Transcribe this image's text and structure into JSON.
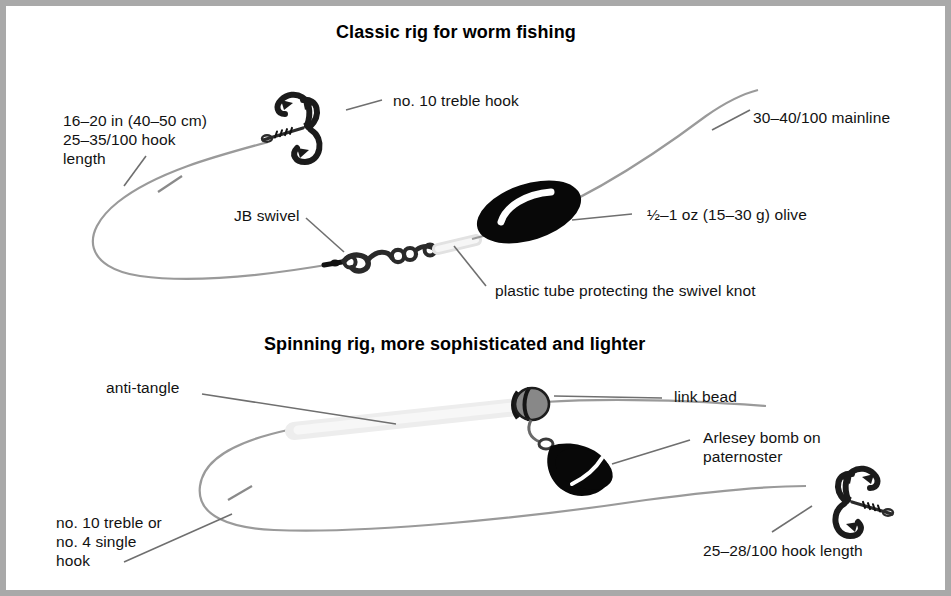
{
  "figure": {
    "frame_color": "#a9a9a9",
    "background": "#ffffff",
    "ink_color": "#121212",
    "line_color": "#808080",
    "tube_color": "#ededed"
  },
  "sections": [
    {
      "id": "classic-rig",
      "heading": "Classic rig for worm fishing",
      "labels": [
        {
          "id": "hook-length",
          "lines": [
            "16–20 in (40–50 cm)",
            "25–35/100 hook",
            "length"
          ]
        },
        {
          "id": "treble-hook",
          "lines": [
            "no. 10 treble hook"
          ]
        },
        {
          "id": "mainline",
          "lines": [
            "30–40/100 mainline"
          ]
        },
        {
          "id": "jb-swivel",
          "lines": [
            "JB swivel"
          ]
        },
        {
          "id": "olive-weight",
          "lines": [
            "½–1 oz (15–30 g) olive"
          ]
        },
        {
          "id": "plastic-tube",
          "lines": [
            "plastic tube protecting the swivel knot"
          ]
        }
      ],
      "components": [
        "treble-hook",
        "jb-swivel",
        "plastic-tube",
        "olive-weight",
        "mainline",
        "hook-length-line"
      ]
    },
    {
      "id": "spinning-rig",
      "heading": "Spinning rig, more sophisticated and lighter",
      "labels": [
        {
          "id": "anti-tangle",
          "lines": [
            "anti-tangle"
          ]
        },
        {
          "id": "link-bead",
          "lines": [
            "link bead"
          ]
        },
        {
          "id": "arlesey-bomb",
          "lines": [
            "Arlesey bomb on",
            "paternoster"
          ]
        },
        {
          "id": "treble-or-single",
          "lines": [
            "no. 10 treble or",
            "no. 4 single",
            "hook"
          ]
        },
        {
          "id": "hook-length-2",
          "lines": [
            "25–28/100 hook length"
          ]
        }
      ],
      "components": [
        "anti-tangle-tube",
        "link-bead",
        "arlesey-bomb",
        "treble-hook-2",
        "mainline-2"
      ]
    }
  ]
}
